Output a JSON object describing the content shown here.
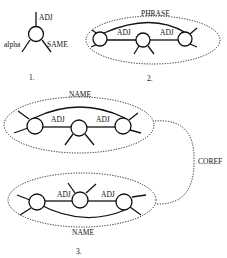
{
  "diagrams": [
    {
      "number": "1.",
      "labels": {
        "top": "ADJ",
        "left": "alpha",
        "right": "SAME"
      }
    },
    {
      "number": "2.",
      "group_label": "PHRASE",
      "edges": [
        "ADJ",
        "ADJ"
      ]
    },
    {
      "number": "3.",
      "top_group": {
        "label": "NAME",
        "edges": [
          "ADJ",
          "ADJ"
        ]
      },
      "bottom_group": {
        "label": "NAME",
        "edges": [
          "ADJ",
          "ADJ"
        ]
      },
      "link_label": "COREF"
    }
  ]
}
